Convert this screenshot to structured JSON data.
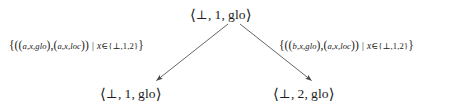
{
  "diagram": {
    "type": "transition-tree",
    "background_color": "#ffffff",
    "text_color": "#1d1d1d",
    "arrow_color": "#4a4a4a",
    "nodes": [
      {
        "id": "root",
        "role": "root-state",
        "text": "⟨ ⊥, 1, glo ⟩",
        "open_bracket": "⟨",
        "close_bracket": "⟩",
        "components": [
          "⊥",
          "1",
          "glo"
        ],
        "x": 190,
        "y": 5
      },
      {
        "id": "left-leaf",
        "role": "successor-state",
        "text": "⟨ ⊥, 1, glo ⟩",
        "open_bracket": "⟨",
        "close_bracket": "⟩",
        "components": [
          "⊥",
          "1",
          "glo"
        ],
        "x": 100,
        "y": 84
      },
      {
        "id": "right-leaf",
        "role": "successor-state",
        "text": "⟨ ⊥, 2, glo ⟩",
        "open_bracket": "⟨",
        "close_bracket": "⟩",
        "components": [
          "⊥",
          "2",
          "glo"
        ],
        "x": 273,
        "y": 84
      }
    ],
    "edges": [
      {
        "id": "edge-left",
        "from": "root",
        "to": "left-leaf",
        "label": "{((a,x,glo),(a,x,loc)) | x ∈ {⊥,1,2}}",
        "label_parts": {
          "open": "{((",
          "first_tuple": "a,x,glo",
          "mid": "),(",
          "second_tuple": "a,x,loc",
          "close_tuple": "))",
          "bar": "|",
          "var": "x",
          "elem": "∈",
          "set": "{⊥,1,2}",
          "close": "}"
        },
        "x1": 228,
        "y1": 24,
        "x2": 156,
        "y2": 81
      },
      {
        "id": "edge-right",
        "from": "root",
        "to": "right-leaf",
        "label": "{((b,x,glo),(a,x,loc)) | x ∈ {⊥,1,2}}",
        "label_parts": {
          "open": "{((",
          "first_tuple": "b,x,glo",
          "mid": "),(",
          "second_tuple": "a,x,loc",
          "close_tuple": "))",
          "bar": "|",
          "var": "x",
          "elem": "∈",
          "set": "{⊥,1,2}",
          "close": "}"
        },
        "x1": 240,
        "y1": 24,
        "x2": 312,
        "y2": 81
      }
    ],
    "symbols": {
      "bottom": "⊥",
      "angle_open": "⟨",
      "angle_close": "⟩",
      "element_of": "∈",
      "such_that": "|"
    }
  }
}
